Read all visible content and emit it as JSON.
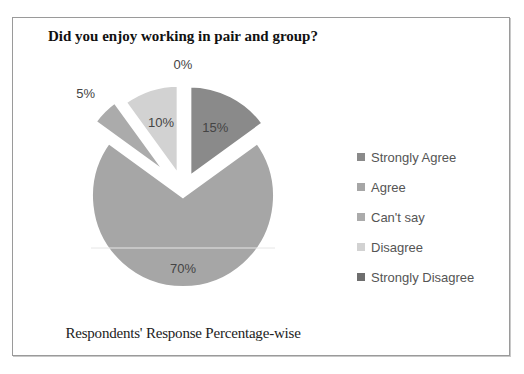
{
  "chart_data": {
    "type": "pie",
    "title": "Did you enjoy working in pair and group?",
    "xlabel": "Respondents' Response Percentage-wise",
    "categories": [
      "Strongly Agree",
      "Agree",
      "Can't say",
      "Disagree",
      "Strongly Disagree"
    ],
    "values": [
      15,
      70,
      5,
      10,
      0
    ],
    "labels": [
      "15%",
      "70%",
      "5%",
      "10%",
      "0%"
    ],
    "colors": [
      "#8a8a8a",
      "#a6a6a6",
      "#ababab",
      "#d2d2d2",
      "#6e6e6e"
    ],
    "legend_position": "right",
    "exploded": true
  },
  "legend": {
    "items": [
      {
        "label": "Strongly Agree",
        "color": "#8a8a8a"
      },
      {
        "label": "Agree",
        "color": "#a6a6a6"
      },
      {
        "label": "Can't say",
        "color": "#ababab"
      },
      {
        "label": "Disagree",
        "color": "#d2d2d2"
      },
      {
        "label": "Strongly Disagree",
        "color": "#6e6e6e"
      }
    ]
  }
}
